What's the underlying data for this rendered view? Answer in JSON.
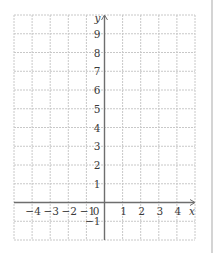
{
  "chart_data": {
    "type": "scatter",
    "title": "",
    "xlabel": "x",
    "ylabel": "y",
    "xlim": [
      -5,
      5
    ],
    "ylim": [
      -2,
      10
    ],
    "grid": true,
    "x_ticks": [
      -4,
      -3,
      -2,
      -1,
      1,
      2,
      3,
      4
    ],
    "x_tick_labels": [
      "−4",
      "−3",
      "−2",
      "−1",
      "1",
      "2",
      "3",
      "4"
    ],
    "y_ticks": [
      1,
      2,
      3,
      4,
      5,
      6,
      7,
      8,
      9,
      -1
    ],
    "y_tick_labels": [
      "1",
      "2",
      "3",
      "4",
      "5",
      "6",
      "7",
      "8",
      "9",
      "−1"
    ],
    "origin_label": "0",
    "series": []
  },
  "colors": {
    "grid": "#c8c8c8",
    "axis": "#6e6e6e",
    "text": "#3a3a3a"
  }
}
